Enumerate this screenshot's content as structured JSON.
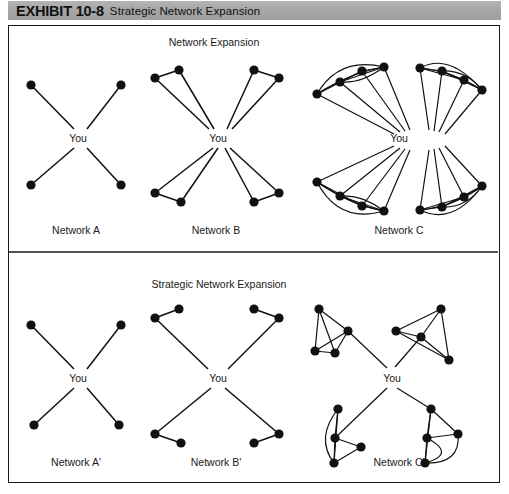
{
  "header": {
    "exhibit_label": "EXHIBIT 10-8",
    "exhibit_title": "Strategic Network Expansion",
    "band_color": "#a8a8a8"
  },
  "figure": {
    "frame_color": "#1a1a1a",
    "node_color": "#111111",
    "edge_color": "#111111",
    "top_panel": {
      "title": "Network Expansion",
      "ego_label_a": "You",
      "ego_label_b": "You",
      "ego_label_c": "You",
      "networks": [
        {
          "name": "Network A",
          "contacts": 4,
          "cluster_size": 1,
          "links_to_ego_per_cluster": 1
        },
        {
          "name": "Network B",
          "contacts": 8,
          "cluster_size": 2,
          "links_to_ego_per_cluster": 2
        },
        {
          "name": "Network C",
          "contacts": 16,
          "cluster_size": 4,
          "links_to_ego_per_cluster": 4
        }
      ]
    },
    "bottom_panel": {
      "title": "Strategic Network Expansion",
      "ego_label_a": "You",
      "ego_label_b": "You",
      "ego_label_c": "You",
      "networks": [
        {
          "name": "Network A'",
          "contacts": 4,
          "cluster_size": 1,
          "links_to_ego_per_cluster": 1
        },
        {
          "name": "Network B'",
          "contacts": 8,
          "cluster_size": 2,
          "links_to_ego_per_cluster": 1
        },
        {
          "name": "Network C'",
          "contacts": 16,
          "cluster_size": 4,
          "links_to_ego_per_cluster": 1
        }
      ]
    }
  }
}
